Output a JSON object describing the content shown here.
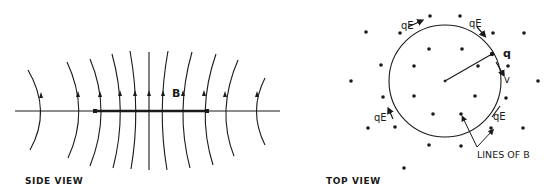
{
  "side_view": {
    "caption": "SIDE VIEW",
    "field_label": "B"
  },
  "top_view": {
    "caption": "TOP VIEW",
    "charge_label": "q",
    "velocity_label": "v",
    "force_labels": [
      "qE",
      "qE",
      "qE",
      "qE"
    ],
    "lines_label": "LINES OF B"
  },
  "colors": {
    "ink": "#1a1a1a",
    "background": "#ffffff"
  }
}
